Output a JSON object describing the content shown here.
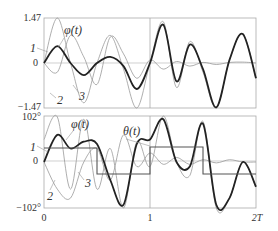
{
  "chart_data": [
    {
      "type": "line",
      "title": "",
      "panel": "top",
      "curve_label": "φ̇(t)",
      "ylabel": "",
      "xlabel": "",
      "yticks": [
        "1.47",
        "0",
        "-1.47"
      ],
      "ylim": [
        -1.47,
        1.47
      ],
      "xlim": [
        0,
        2
      ],
      "grid": false,
      "vertical_marker_at": 1,
      "series": [
        {
          "name": "1",
          "style": "thick dark",
          "x": [
            0,
            0.125,
            0.25,
            0.375,
            0.5,
            0.625,
            0.75,
            0.875,
            1.0,
            1.125,
            1.25,
            1.375,
            1.5,
            1.625,
            1.75,
            1.875,
            2.0
          ],
          "values": [
            0,
            0.55,
            0,
            -0.4,
            0,
            0.2,
            -0.1,
            -0.85,
            0,
            1.25,
            -0.6,
            0.6,
            -0.2,
            -1.45,
            0.1,
            0.95,
            -0.5
          ]
        },
        {
          "name": "2",
          "style": "thin gray",
          "values": [
            0,
            1.47,
            0,
            -1.3,
            0,
            0.9,
            -0.2,
            -1.47,
            0,
            1.35,
            -0.8,
            0.7,
            -0.3,
            -1.47,
            0.1,
            0.95,
            -0.5
          ]
        },
        {
          "name": "3",
          "style": "thin gray",
          "values": [
            0,
            -0.3,
            0.9,
            0.2,
            -0.7,
            0.85,
            0.3,
            -0.5,
            0.1,
            -0.2,
            0.05,
            -0.1,
            0.02,
            -0.05,
            0.02,
            0.03,
            0.0
          ]
        }
      ]
    },
    {
      "type": "line",
      "title": "",
      "panel": "bottom",
      "curve_label": "φ(t)",
      "step_label": "θ(t)",
      "yticks": [
        "102°",
        "0",
        "-102°"
      ],
      "ylim": [
        -102,
        102
      ],
      "xticks": [
        "0",
        "1",
        "2T"
      ],
      "xlim": [
        0,
        2
      ],
      "grid": false,
      "vertical_marker_at": 1,
      "step_series": {
        "name": "θ(t)",
        "x": [
          0,
          0.5,
          1.0,
          1.5,
          2.0
        ],
        "values": [
          30,
          -30,
          32,
          -30,
          -30
        ]
      },
      "series": [
        {
          "name": "1",
          "style": "thick dark",
          "values": [
            0,
            60,
            30,
            45,
            40,
            -40,
            -95,
            40,
            50,
            95,
            0,
            -10,
            85,
            -95,
            -80,
            0,
            -55
          ]
        },
        {
          "name": "2",
          "style": "thin gray",
          "values": [
            50,
            100,
            -60,
            95,
            -60,
            30,
            -102,
            45,
            -10,
            102,
            0,
            -30,
            90,
            -102,
            -80,
            0,
            -55
          ]
        },
        {
          "name": "3",
          "style": "thin gray",
          "values": [
            0,
            -60,
            -80,
            0,
            30,
            -40,
            60,
            -10,
            20,
            -5,
            10,
            -5,
            5,
            -2,
            5,
            0,
            0
          ]
        }
      ]
    }
  ],
  "labels": {
    "top_ymax": "1.47",
    "top_zero": "0",
    "top_ymin": "−1.47",
    "top_curve": "φ̇(t)",
    "bot_ymax": "102°",
    "bot_zero": "0",
    "bot_ymin": "−102°",
    "bot_curve": "φ(t)",
    "bot_step": "θ(t)",
    "x0": "0",
    "x1": "1",
    "x2": "2T",
    "n1": "1",
    "n2": "2",
    "n3": "3"
  }
}
